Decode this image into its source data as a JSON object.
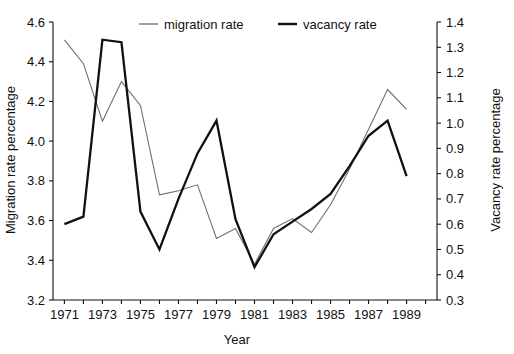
{
  "chart_data": {
    "type": "line",
    "title": "",
    "subtitle": "",
    "xlabel": "Year",
    "ylabel": "Migration rate percentage",
    "y2label": "Vacancy rate percentage",
    "grid": false,
    "legend_position": "top-center",
    "xlim": [
      1970.4,
      1990.6
    ],
    "ylim": [
      3.2,
      4.6
    ],
    "y2lim": [
      0.3,
      1.4
    ],
    "x": [
      1971,
      1972,
      1973,
      1974,
      1975,
      1976,
      1977,
      1978,
      1979,
      1980,
      1981,
      1982,
      1983,
      1984,
      1985,
      1986,
      1987,
      1988,
      1989
    ],
    "xticks": [
      1971,
      1973,
      1975,
      1977,
      1979,
      1981,
      1983,
      1985,
      1987,
      1989
    ],
    "xticklabels": [
      "1971",
      "1973",
      "1975",
      "1977",
      "1979",
      "1981",
      "1983",
      "1985",
      "1987",
      "1989"
    ],
    "yticks": [
      3.2,
      3.4,
      3.6,
      3.8,
      4.0,
      4.2,
      4.4,
      4.6
    ],
    "yticklabels": [
      "3.2",
      "3.4",
      "3.6",
      "3.8",
      "4.0",
      "4.2",
      "4.4",
      "4.6"
    ],
    "y2ticks": [
      0.3,
      0.4,
      0.5,
      0.6,
      0.7,
      0.8,
      0.9,
      1.0,
      1.1,
      1.2,
      1.3,
      1.4
    ],
    "y2ticklabels": [
      "0.3",
      "0.4",
      "0.5",
      "0.6",
      "0.7",
      "0.8",
      "0.9",
      "1.0",
      "1.1",
      "1.2",
      "1.3",
      "1.4"
    ],
    "series": [
      {
        "name": "migration rate",
        "axis": "left",
        "color": "#6f6f6f",
        "linewidth": 1.1,
        "values": [
          4.51,
          4.39,
          4.1,
          4.3,
          4.18,
          3.73,
          3.75,
          3.78,
          3.51,
          3.56,
          3.38,
          3.56,
          3.61,
          3.54,
          3.68,
          3.86,
          4.06,
          4.26,
          4.16
        ]
      },
      {
        "name": "vacancy rate",
        "axis": "right",
        "color": "#111111",
        "linewidth": 2.3,
        "values": [
          0.6,
          0.63,
          1.33,
          1.32,
          0.65,
          0.5,
          0.7,
          0.88,
          1.01,
          0.62,
          0.43,
          0.56,
          0.61,
          0.66,
          0.72,
          0.83,
          0.95,
          1.01,
          0.79
        ]
      }
    ],
    "legend": [
      {
        "label": "migration rate",
        "color": "#6f6f6f",
        "style": "thin-line"
      },
      {
        "label": "vacancy rate",
        "color": "#111111",
        "style": "thick-line"
      }
    ]
  },
  "figure": {
    "background": "#ffffff",
    "axis_color": "#111111"
  }
}
